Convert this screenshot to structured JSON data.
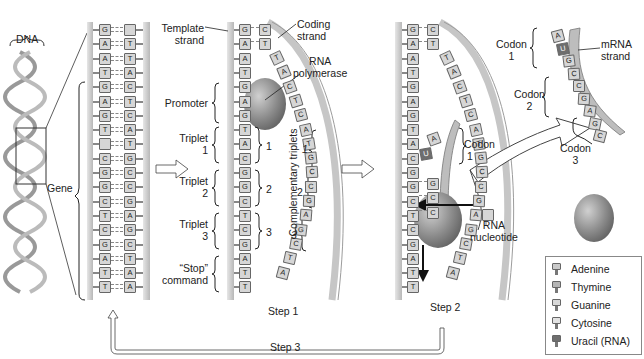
{
  "labels": {
    "dna": "DNA",
    "gene": "Gene",
    "template_strand": [
      "Template",
      "strand"
    ],
    "coding_strand": [
      "Coding",
      "strand"
    ],
    "rna_polymerase": [
      "RNA",
      "polymerase"
    ],
    "promoter": "Promoter",
    "triplet1": [
      "Triplet",
      "1"
    ],
    "triplet2": [
      "Triplet",
      "2"
    ],
    "triplet3": [
      "Triplet",
      "3"
    ],
    "stop_command": [
      "“Stop”",
      "command"
    ],
    "brace_num_1": "1",
    "brace_num_2": "2",
    "brace_num_3": "3",
    "complementary_triplets": "Complementary triplets",
    "comp_1": "1",
    "comp_2": "2",
    "comp_3": "3",
    "codon1_step2": [
      "Codon",
      "1"
    ],
    "rna_nucleotide": [
      "RNA",
      "nucleotide"
    ],
    "codon1": [
      "Codon",
      "1"
    ],
    "codon2": [
      "Codon",
      "2"
    ],
    "codon3": [
      "Codon",
      "3"
    ],
    "mrna_strand": [
      "mRNA",
      "strand"
    ],
    "step1": "Step 1",
    "step2": "Step 2",
    "step3": "Step 3"
  },
  "gene_panel": {
    "template": [
      "G",
      "A",
      "A",
      "T",
      "G",
      "A",
      "G",
      "T",
      "",
      "C",
      "G",
      "G",
      "C",
      "T",
      "C",
      "G",
      "A",
      "T",
      "T"
    ],
    "coding": [
      "",
      "T",
      "T",
      "A",
      "C",
      "T",
      "C",
      "A",
      "T",
      "G",
      "C",
      "C",
      "G",
      "A",
      "G",
      "C",
      "T",
      "A",
      "A"
    ]
  },
  "step1_panel": {
    "template": [
      "G",
      "A",
      "A",
      "T",
      "G",
      "A",
      "G",
      "T",
      "A",
      "C",
      "G",
      "G",
      "C",
      "T",
      "C",
      "G",
      "A",
      "T",
      "T"
    ],
    "coding_paired": [
      "C",
      "T"
    ],
    "coding_curve": [
      "T",
      "A",
      "C",
      "T",
      "C",
      "A",
      "T",
      "G",
      "C",
      "C",
      "G",
      "A",
      "G",
      "C",
      "T",
      "A"
    ]
  },
  "step2_panel": {
    "template": [
      "G",
      "A",
      "A",
      "T",
      "G",
      "A",
      "G",
      "T",
      "A",
      "C",
      "G",
      "G",
      "C",
      "T",
      "C",
      "G",
      "A",
      "T",
      "T"
    ],
    "coding_paired": [
      "C",
      "T"
    ],
    "coding_curve": [
      "T",
      "A",
      "C",
      "T",
      "C",
      "A",
      "T",
      "G",
      "C",
      "C",
      "G",
      "A",
      "G",
      "C",
      "T",
      "A"
    ],
    "rna_paired": [
      "G",
      "C",
      "C"
    ]
  },
  "mrna": {
    "bases": [
      "A",
      "U",
      "G",
      "C",
      "C",
      "G",
      "A",
      "G",
      "C"
    ]
  },
  "legend": {
    "items": [
      {
        "label": "Adenine",
        "color": "#c9c9c9"
      },
      {
        "label": "Thymine",
        "color": "#b5b5b5"
      },
      {
        "label": "Guanine",
        "color": "#d8d8d8"
      },
      {
        "label": "Cytosine",
        "color": "#e2e2e2"
      },
      {
        "label": "Uracil (RNA)",
        "color": "#6e6e6e"
      }
    ]
  },
  "colors": {
    "backbone": "#c8c8c8",
    "base_fill": "#d4d4d4",
    "polymerase": "#8f8f8f",
    "line": "#333333"
  }
}
